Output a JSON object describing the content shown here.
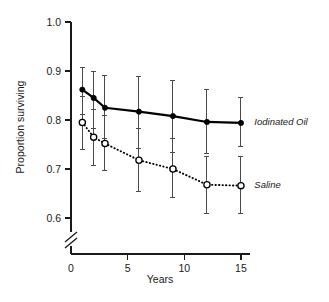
{
  "chart_data": {
    "type": "line",
    "title": "",
    "xlabel": "Years",
    "ylabel": "Proportion surviving",
    "xlim": [
      0,
      15.8
    ],
    "ylim": [
      0.575,
      1.0
    ],
    "y_axis_break": true,
    "grid": false,
    "legend_position": "right-inline",
    "xticks": [
      "0",
      "5",
      "10",
      "15"
    ],
    "xtick_values": [
      0,
      5,
      10,
      15
    ],
    "yticks": [
      "1.0",
      "0.9",
      "0.8",
      "0.7",
      "0.6"
    ],
    "ytick_values": [
      1.0,
      0.9,
      0.8,
      0.7,
      0.6
    ],
    "series": [
      {
        "name": "Iodinated Oil",
        "marker": "filled-circle",
        "linestyle": "solid",
        "color": "#000000",
        "x": [
          1,
          2,
          3,
          6,
          9,
          12,
          15
        ],
        "values": [
          0.862,
          0.845,
          0.825,
          0.817,
          0.808,
          0.796,
          0.794
        ],
        "err_low": [
          0.812,
          0.783,
          0.762,
          0.742,
          0.733,
          0.732,
          0.745
        ],
        "err_high": [
          0.908,
          0.898,
          0.89,
          0.888,
          0.88,
          0.862,
          0.845
        ]
      },
      {
        "name": "Saline",
        "marker": "open-circle",
        "linestyle": "dotted",
        "color": "#000000",
        "x": [
          1,
          2,
          3,
          6,
          9,
          12,
          15
        ],
        "values": [
          0.795,
          0.765,
          0.752,
          0.718,
          0.7,
          0.668,
          0.666
        ],
        "err_low": [
          0.74,
          0.708,
          0.697,
          0.655,
          0.641,
          0.609,
          0.61
        ],
        "err_high": [
          0.848,
          0.822,
          0.81,
          0.782,
          0.762,
          0.726,
          0.725
        ]
      }
    ],
    "annotations": [
      {
        "text": "Iodinated Oil",
        "x": 15.3,
        "y": 0.794
      },
      {
        "text": "Saline",
        "x": 15.3,
        "y": 0.666
      }
    ]
  },
  "axes": {
    "ylabel": "Proportion surviving",
    "xlabel": "Years"
  }
}
